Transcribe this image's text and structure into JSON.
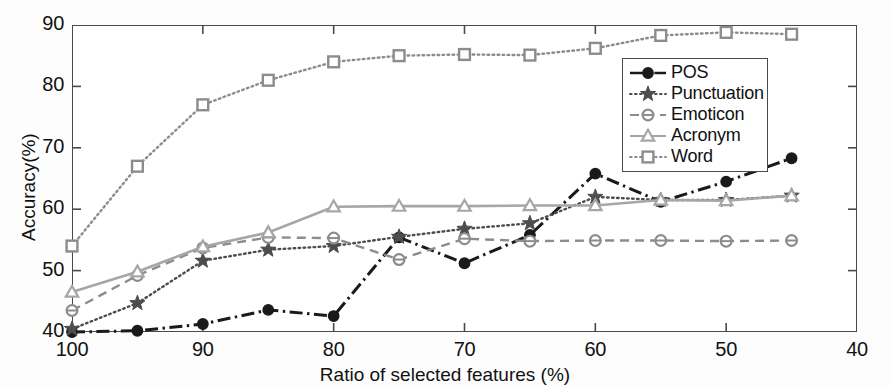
{
  "chart_data": {
    "type": "line",
    "title": "",
    "xlabel": "Ratio of selected features (%)",
    "ylabel": "Accuracy(%)",
    "xlim": [
      100,
      40
    ],
    "ylim": [
      40,
      90
    ],
    "x_ticks": [
      100,
      90,
      80,
      70,
      60,
      50,
      40
    ],
    "y_ticks": [
      40,
      50,
      60,
      70,
      80,
      90
    ],
    "x_reversed": true,
    "grid": false,
    "legend_position": "top-right-inside",
    "x": [
      100,
      95,
      90,
      85,
      80,
      75,
      70,
      65,
      60,
      55,
      50,
      45
    ],
    "series": [
      {
        "name": "POS",
        "marker": "filled-circle",
        "linestyle": "dash-dot",
        "color": "#1a1a1a",
        "values": [
          40.0,
          40.2,
          41.3,
          43.6,
          42.6,
          55.4,
          51.2,
          55.8,
          65.8,
          61.2,
          64.5,
          68.3
        ]
      },
      {
        "name": "Punctuation",
        "marker": "filled-star",
        "linestyle": "dotted",
        "color": "#4d4d4d",
        "values": [
          40.5,
          44.7,
          51.6,
          53.4,
          54.0,
          55.5,
          56.8,
          57.7,
          62.0,
          61.5,
          61.5,
          62.2
        ]
      },
      {
        "name": "Emoticon",
        "marker": "open-circle",
        "linestyle": "dashed",
        "color": "#8c8c8c",
        "values": [
          43.5,
          49.2,
          53.7,
          55.4,
          55.3,
          51.8,
          55.2,
          54.8,
          54.9,
          54.9,
          54.8,
          54.9
        ]
      },
      {
        "name": "Acronym",
        "marker": "open-triangle",
        "linestyle": "solid",
        "color": "#a6a6a6",
        "values": [
          46.5,
          49.8,
          53.9,
          56.2,
          60.4,
          60.5,
          60.5,
          60.6,
          60.6,
          61.5,
          61.4,
          62.2
        ]
      },
      {
        "name": "Word",
        "marker": "open-square",
        "linestyle": "dotted",
        "color": "#8c8c8c",
        "values": [
          54.0,
          67.0,
          77.0,
          81.0,
          84.0,
          85.0,
          85.2,
          85.1,
          86.2,
          88.3,
          88.8,
          88.5
        ]
      }
    ]
  },
  "axes": {
    "y_tick_labels": [
      "90",
      "80",
      "70",
      "60",
      "50",
      "40"
    ],
    "x_tick_labels": [
      "100",
      "90",
      "80",
      "70",
      "60",
      "50",
      "40"
    ],
    "y_axis_title": "Accuracy(%)",
    "x_axis_title": "Ratio of selected features (%)"
  },
  "legend": {
    "entries": [
      {
        "label": "POS"
      },
      {
        "label": "Punctuation"
      },
      {
        "label": "Emoticon"
      },
      {
        "label": "Acronym"
      },
      {
        "label": "Word"
      }
    ]
  }
}
